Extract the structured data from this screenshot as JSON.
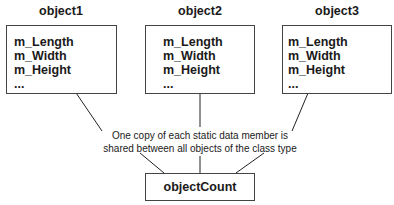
{
  "objects": [
    {
      "name": "object1",
      "fields": [
        "m_Length",
        "m_Width",
        "m_Height",
        "..."
      ]
    },
    {
      "name": "object2",
      "fields": [
        "m_Length",
        "m_Width",
        "m_Height",
        "..."
      ]
    },
    {
      "name": "object3",
      "fields": [
        "m_Length",
        "m_Width",
        "m_Height",
        "..."
      ]
    }
  ],
  "note": {
    "line1": "One copy of each static data member is",
    "line2": "shared between all objects of the class type"
  },
  "static_member": "objectCount"
}
